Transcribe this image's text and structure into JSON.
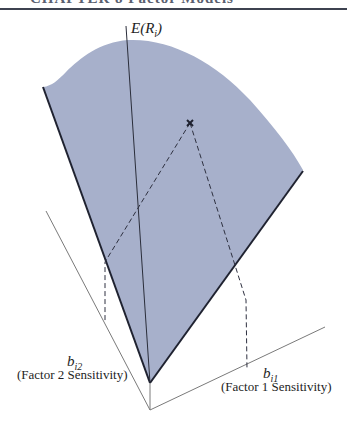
{
  "header": {
    "title_partial": "CHAPTER 8 Factor Models"
  },
  "diagram": {
    "type": "3d-factor-surface",
    "colors": {
      "surface_fill": "#a7b0cb",
      "edge": "#1f2230",
      "axis": "#7a7a7a",
      "dashed": "#2e3040"
    },
    "vertical_axis": {
      "label_main": "E(R",
      "label_sub": "i",
      "label_close": ")"
    },
    "axis_factor2": {
      "symbol_main": "b",
      "symbol_sub": "i2",
      "description": "(Factor 2 Sensitivity)"
    },
    "axis_factor1": {
      "symbol_main": "b",
      "symbol_sub": "i1",
      "description": "(Factor 1 Sensitivity)"
    },
    "point_marker": "×"
  }
}
